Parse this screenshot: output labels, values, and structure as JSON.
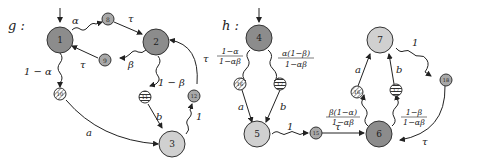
{
  "graphs": [
    {
      "name": "g",
      "label": "g :",
      "nodes": [
        {
          "id": "1",
          "label": "1",
          "size": "large",
          "fill": "#8c8c8c"
        },
        {
          "id": "2",
          "label": "2",
          "size": "large",
          "fill": "#8c8c8c"
        },
        {
          "id": "3",
          "label": "3",
          "size": "large",
          "fill": "#d0d0d0"
        },
        {
          "id": "8",
          "label": "8",
          "size": "small",
          "fill": "#a8a8a8"
        },
        {
          "id": "9",
          "label": "9",
          "size": "small",
          "fill": "#a8a8a8"
        },
        {
          "id": "10",
          "label": "10",
          "size": "small",
          "pattern": "diagonal-hatch"
        },
        {
          "id": "11",
          "label": "11",
          "size": "small",
          "pattern": "horizontal-stripes"
        },
        {
          "id": "12",
          "label": "12",
          "size": "small",
          "fill": "#a8a8a8"
        }
      ],
      "edges": [
        {
          "from": "1",
          "to": "8",
          "label": "α",
          "style": "wavy"
        },
        {
          "from": "8",
          "to": "2",
          "label": "τ",
          "style": "straight"
        },
        {
          "from": "2",
          "to": "9",
          "label": "β",
          "style": "wavy"
        },
        {
          "from": "9",
          "to": "1",
          "label": "τ",
          "style": "straight"
        },
        {
          "from": "1",
          "to": "10",
          "label": "1 − α",
          "style": "wavy"
        },
        {
          "from": "2",
          "to": "11",
          "label": "1 − β",
          "style": "wavy"
        },
        {
          "from": "10",
          "to": "3",
          "label": "a",
          "style": "straight"
        },
        {
          "from": "11",
          "to": "3",
          "label": "b",
          "style": "straight"
        },
        {
          "from": "3",
          "to": "12",
          "label": "1",
          "style": "wavy"
        },
        {
          "from": "12",
          "to": "2",
          "label": "τ",
          "style": "straight"
        }
      ],
      "initial": "1"
    },
    {
      "name": "h",
      "label": "h :",
      "nodes": [
        {
          "id": "4",
          "label": "4",
          "size": "large",
          "fill": "#8c8c8c"
        },
        {
          "id": "5",
          "label": "5",
          "size": "large",
          "fill": "#d0d0d0"
        },
        {
          "id": "6",
          "label": "6",
          "size": "large",
          "fill": "#8c8c8c"
        },
        {
          "id": "7",
          "label": "7",
          "size": "large",
          "fill": "#d0d0d0"
        },
        {
          "id": "15",
          "label": "15",
          "size": "small",
          "fill": "#a8a8a8"
        },
        {
          "id": "16a",
          "label": "16",
          "size": "small",
          "pattern": "diagonal-hatch"
        },
        {
          "id": "17a",
          "label": "17",
          "size": "small",
          "pattern": "horizontal-stripes"
        },
        {
          "id": "16b",
          "label": "16",
          "size": "small",
          "pattern": "diagonal-hatch"
        },
        {
          "id": "17b",
          "label": "17",
          "size": "small",
          "pattern": "horizontal-stripes"
        },
        {
          "id": "18",
          "label": "18",
          "size": "small",
          "fill": "#a8a8a8"
        }
      ],
      "edges": [
        {
          "from": "4",
          "to": "16a",
          "label_num": "1−α",
          "label_den": "1−αβ",
          "style": "wavy"
        },
        {
          "from": "4",
          "to": "17a",
          "label_num": "α(1−β)",
          "label_den": "1−αβ",
          "style": "wavy"
        },
        {
          "from": "16a",
          "to": "5",
          "label": "a",
          "style": "straight"
        },
        {
          "from": "17a",
          "to": "5",
          "label": "b",
          "style": "straight"
        },
        {
          "from": "5",
          "to": "15",
          "label": "1",
          "style": "wavy"
        },
        {
          "from": "15",
          "to": "6",
          "label": "τ",
          "style": "straight"
        },
        {
          "from": "6",
          "to": "16b",
          "label_num": "β(1−α)",
          "label_den": "1−αβ",
          "style": "wavy"
        },
        {
          "from": "6",
          "to": "17b",
          "label_num": "1−β",
          "label_den": "1−αβ",
          "style": "wavy"
        },
        {
          "from": "16b",
          "to": "7",
          "label": "a",
          "style": "straight"
        },
        {
          "from": "17b",
          "to": "7",
          "label": "b",
          "style": "straight"
        },
        {
          "from": "7",
          "to": "18",
          "label": "1",
          "style": "wavy"
        },
        {
          "from": "18",
          "to": "6",
          "label": "τ",
          "style": "straight"
        }
      ],
      "initial": "4"
    }
  ],
  "labels": {
    "g": "g :",
    "h": "h :",
    "alpha": "α",
    "beta": "β",
    "tau": "τ",
    "one_minus_alpha": "1 − α",
    "one_minus_beta": "1 − β",
    "a": "a",
    "b": "b",
    "one": "1",
    "h_f1_num": "1−α",
    "h_f1_den": "1−αβ",
    "h_f2_num": "α(1−β)",
    "h_f2_den": "1−αβ",
    "h_f3_num": "β(1−α)",
    "h_f3_den": "1−αβ",
    "h_f4_num": "1−β",
    "h_f4_den": "1−αβ"
  },
  "node_labels": {
    "n1": "1",
    "n2": "2",
    "n3": "3",
    "n8": "8",
    "n9": "9",
    "n10": "10",
    "n11": "11",
    "n12": "12",
    "n4": "4",
    "n5": "5",
    "n6": "6",
    "n7": "7",
    "n15": "15",
    "n16a": "16",
    "n17a": "17",
    "n16b": "16",
    "n17b": "17",
    "n18": "18"
  },
  "colors": {
    "dark_node": "#8c8c8c",
    "light_node": "#d0d0d0",
    "small_node": "#a8a8a8",
    "stroke": "#222222"
  }
}
